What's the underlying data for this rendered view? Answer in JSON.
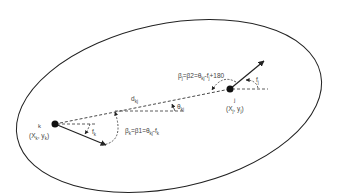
{
  "diagram": {
    "node_k": {
      "name": "k",
      "coords": "(X",
      "coords_sub1": "k",
      "coords_mid": ", y",
      "coords_sub2": "k",
      "coords_end": ")"
    },
    "node_j": {
      "name": "j",
      "coords": "(X",
      "coords_sub1": "j",
      "coords_mid": ", y",
      "coords_sub2": "j",
      "coords_end": ")"
    },
    "distance_label": "d",
    "distance_sub": "kj",
    "theta_label": "θ",
    "theta_sub": "kj",
    "angle_k_label": "f",
    "angle_k_sub": "k",
    "angle_j_label": "f",
    "angle_j_sub": "j",
    "beta_k": {
      "text": "β",
      "sub": "k",
      "rest": "=β1=θ",
      "sub2": "kj",
      "rest2": "-f",
      "sub3": "k"
    },
    "beta_j": {
      "text": "β",
      "sub": "j",
      "rest": "=β2=θ",
      "sub2": "kj",
      "rest2": "-f",
      "sub3": "j",
      "rest3": "+180"
    },
    "colors": {
      "stroke": "#222222",
      "dash": "#333333",
      "text": "#444444"
    }
  }
}
